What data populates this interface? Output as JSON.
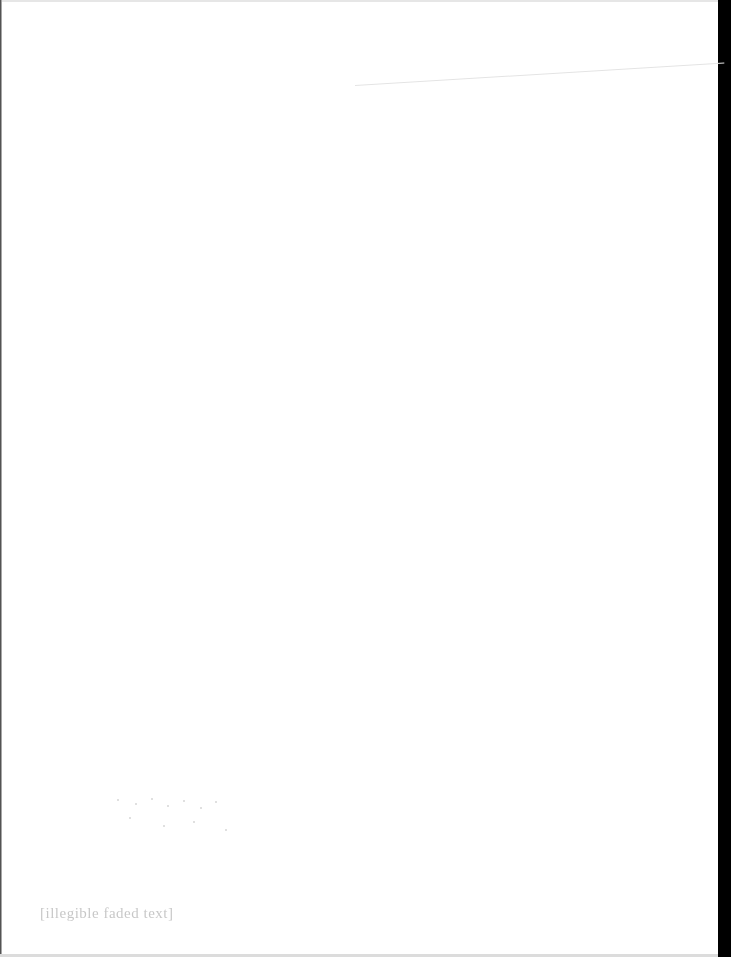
{
  "document": {
    "type": "scanned-page",
    "background_color": "#ffffff",
    "edge_band_color": "#000000",
    "footer": {
      "text": "[illegible faded text]"
    }
  }
}
